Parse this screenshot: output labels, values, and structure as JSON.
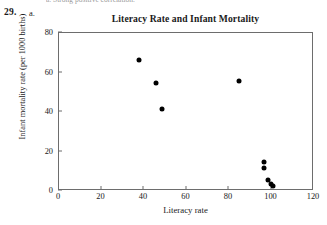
{
  "page": {
    "cut_off_line": "a. Strong positive correlation.",
    "problem_number": "29.",
    "problem_part": "a."
  },
  "chart_data": {
    "type": "scatter",
    "title": "Literacy Rate and Infant Mortality",
    "xlabel": "Literacy rate",
    "ylabel": "Infant mortality rate (per 1000 births)",
    "xlim": [
      0,
      120
    ],
    "ylim": [
      0,
      80
    ],
    "xticks": [
      0,
      20,
      40,
      60,
      80,
      100,
      120
    ],
    "yticks": [
      0,
      20,
      40,
      60,
      80
    ],
    "grid": false,
    "legend": null,
    "marker": "filled-circle",
    "marker_color": "#000000",
    "points": [
      {
        "x": 38,
        "y": 66
      },
      {
        "x": 46,
        "y": 54
      },
      {
        "x": 49,
        "y": 41
      },
      {
        "x": 85,
        "y": 55
      },
      {
        "x": 97,
        "y": 14
      },
      {
        "x": 97,
        "y": 11
      },
      {
        "x": 99,
        "y": 5
      },
      {
        "x": 100,
        "y": 3
      },
      {
        "x": 101,
        "y": 2
      }
    ]
  }
}
